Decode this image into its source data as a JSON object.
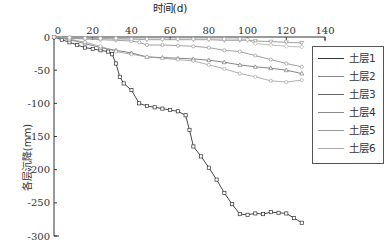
{
  "chart_data": {
    "type": "line",
    "title": "",
    "xlabel": "时间(d)",
    "ylabel": "各层沉降(mm)",
    "xlim": [
      0,
      140
    ],
    "ylim": [
      -300,
      0
    ],
    "x_ticks": [
      "0",
      "20",
      "40",
      "60",
      "80",
      "100",
      "120",
      "140"
    ],
    "y_ticks": [
      "0",
      "-50",
      "-100",
      "-150",
      "-200",
      "-250",
      "-300"
    ],
    "x_axis_position": "top",
    "grid": false,
    "legend_position": "right",
    "series": [
      {
        "name": "土层1",
        "color": "#333333",
        "marker": "square",
        "x": [
          0,
          4,
          8,
          12,
          16,
          20,
          24,
          28,
          30,
          32,
          34,
          36,
          40,
          44,
          48,
          52,
          56,
          60,
          64,
          68,
          70,
          72,
          76,
          80,
          84,
          88,
          92,
          96,
          100,
          104,
          108,
          112,
          116,
          120,
          124,
          128
        ],
        "y": [
          0,
          -4,
          -8,
          -12,
          -16,
          -18,
          -20,
          -22,
          -26,
          -40,
          -60,
          -70,
          -80,
          -100,
          -104,
          -106,
          -108,
          -110,
          -112,
          -118,
          -140,
          -165,
          -180,
          -197,
          -215,
          -235,
          -252,
          -267,
          -268,
          -266,
          -267,
          -264,
          -265,
          -266,
          -273,
          -280
        ]
      },
      {
        "name": "土层2",
        "color": "#888888",
        "marker": "circle",
        "x": [
          0,
          8,
          16,
          24,
          32,
          40,
          44,
          48,
          56,
          64,
          72,
          80,
          88,
          96,
          104,
          112,
          120,
          128
        ],
        "y": [
          0,
          -2,
          -3,
          -4,
          -5,
          -6,
          -8,
          -12,
          -12,
          -13,
          -14,
          -16,
          -20,
          -22,
          -28,
          -34,
          -40,
          -45
        ]
      },
      {
        "name": "土层3",
        "color": "#666666",
        "marker": "triangle",
        "x": [
          0,
          8,
          16,
          24,
          32,
          40,
          48,
          56,
          64,
          72,
          80,
          88,
          96,
          104,
          112,
          120,
          128
        ],
        "y": [
          0,
          -4,
          -10,
          -16,
          -20,
          -24,
          -30,
          -31,
          -32,
          -33,
          -35,
          -38,
          -42,
          -45,
          -47,
          -50,
          -55
        ]
      },
      {
        "name": "土层4",
        "color": "#888888",
        "marker": "triangle-down",
        "x": [
          0,
          8,
          16,
          24,
          32,
          40,
          48,
          56,
          64,
          72,
          80,
          88,
          96,
          100,
          104,
          112,
          120,
          128
        ],
        "y": [
          0,
          -1,
          -2,
          -2,
          -3,
          -3,
          -4,
          -4,
          -4,
          -4,
          -4,
          -5,
          -5,
          -5,
          -6,
          -7,
          -8,
          -9
        ]
      },
      {
        "name": "土层5",
        "color": "#999999",
        "marker": "circle",
        "x": [
          0,
          8,
          16,
          24,
          32,
          40,
          48,
          56,
          64,
          72,
          80,
          88,
          96,
          104,
          112,
          120,
          128
        ],
        "y": [
          0,
          -3,
          -8,
          -14,
          -22,
          -26,
          -30,
          -32,
          -34,
          -36,
          -42,
          -48,
          -55,
          -60,
          -66,
          -68,
          -65
        ]
      },
      {
        "name": "土层6",
        "color": "#aaaaaa",
        "marker": "diamond",
        "x": [
          0,
          8,
          16,
          24,
          32,
          40,
          48,
          56,
          64,
          72,
          80,
          88,
          96,
          100,
          104,
          112,
          120,
          128
        ],
        "y": [
          0,
          -1,
          -2,
          -2,
          -2,
          -3,
          -3,
          -3,
          -3,
          -3,
          -3,
          -3,
          -3,
          -4,
          -10,
          -12,
          -14,
          -15
        ]
      }
    ]
  },
  "legend": {
    "items": [
      "土层1",
      "土层2",
      "土层3",
      "土层4",
      "土层5",
      "土层6"
    ]
  }
}
